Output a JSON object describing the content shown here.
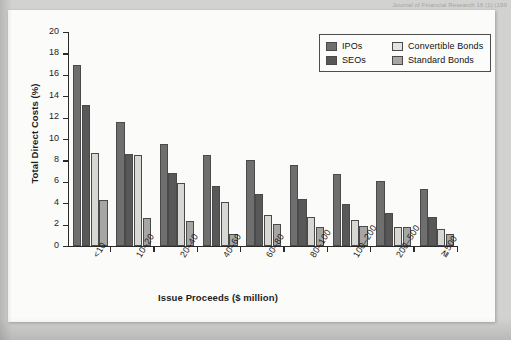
{
  "document": {
    "header_text": "Journal of Financial Research 16 (1) (199"
  },
  "chart_data": {
    "type": "bar",
    "title": "",
    "xlabel": "Issue Proceeds ($ million)",
    "ylabel": "Total Direct Costs (%)",
    "ylim": [
      0,
      20
    ],
    "yticks": [
      0,
      2,
      4,
      6,
      8,
      10,
      12,
      14,
      16,
      18,
      20
    ],
    "ytick_labels": [
      "0",
      "2",
      "4",
      "6",
      "8",
      "10",
      "12",
      "14",
      "16",
      "18",
      "20"
    ],
    "grid": false,
    "legend_position": "top-right",
    "categories": [
      "<10",
      "10–20",
      "20–40",
      "40–60",
      "60–80",
      "80–100",
      "100–200",
      "200–500",
      "≧500"
    ],
    "series": [
      {
        "name": "IPOs",
        "color": "#6f6f6f",
        "values": [
          16.9,
          11.6,
          9.5,
          8.5,
          8.0,
          7.6,
          6.7,
          6.1,
          5.3
        ]
      },
      {
        "name": "SEOs",
        "color": "#585858",
        "values": [
          13.2,
          8.6,
          6.8,
          5.6,
          4.9,
          4.4,
          3.9,
          3.1,
          2.7
        ]
      },
      {
        "name": "Convertible Bonds",
        "color": "#d7d7d4",
        "values": [
          8.7,
          8.5,
          5.9,
          4.1,
          2.9,
          2.7,
          2.4,
          1.8,
          1.6
        ]
      },
      {
        "name": "Standard Bonds",
        "color": "#a6a6a4",
        "values": [
          4.3,
          2.6,
          2.3,
          1.1,
          2.1,
          1.8,
          1.9,
          1.75,
          1.1
        ]
      }
    ]
  }
}
